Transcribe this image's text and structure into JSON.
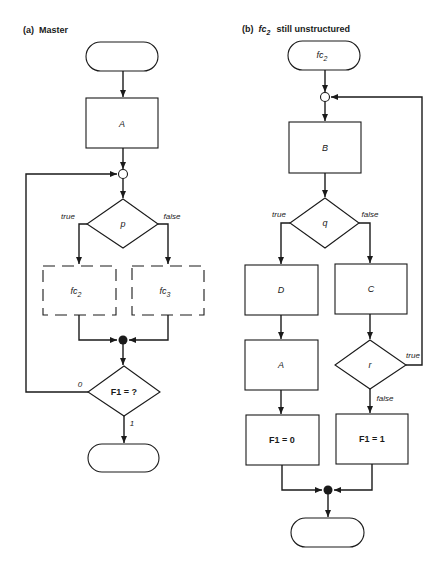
{
  "panel_a": {
    "title_prefix": "(a)",
    "title": "Master",
    "nodes": {
      "start": "",
      "box_a": "A",
      "decision_p": "p",
      "sub_fc2_main": "fc",
      "sub_fc2_sub": "2",
      "sub_fc3_main": "fc",
      "sub_fc3_sub": "3",
      "decision_f1": "F1 = ?",
      "end": ""
    },
    "edges": {
      "p_true": "true",
      "p_false": "false",
      "f1_zero": "0",
      "f1_one": "1"
    }
  },
  "panel_b": {
    "title_prefix": "(b)",
    "title_fc": "fc",
    "title_sub": "2",
    "title_rest": "still unstructured",
    "nodes": {
      "start_main": "fc",
      "start_sub": "2",
      "box_b": "B",
      "decision_q": "q",
      "box_d": "D",
      "box_c": "C",
      "box_a": "A",
      "decision_r": "r",
      "assign_f1_0": "F1 = 0",
      "assign_f1_1": "F1 = 1",
      "end": ""
    },
    "edges": {
      "q_true": "true",
      "q_false": "false",
      "r_true": "true",
      "r_false": "false"
    }
  },
  "colors": {
    "ink": "#1a1a1a",
    "background": "#ffffff"
  }
}
